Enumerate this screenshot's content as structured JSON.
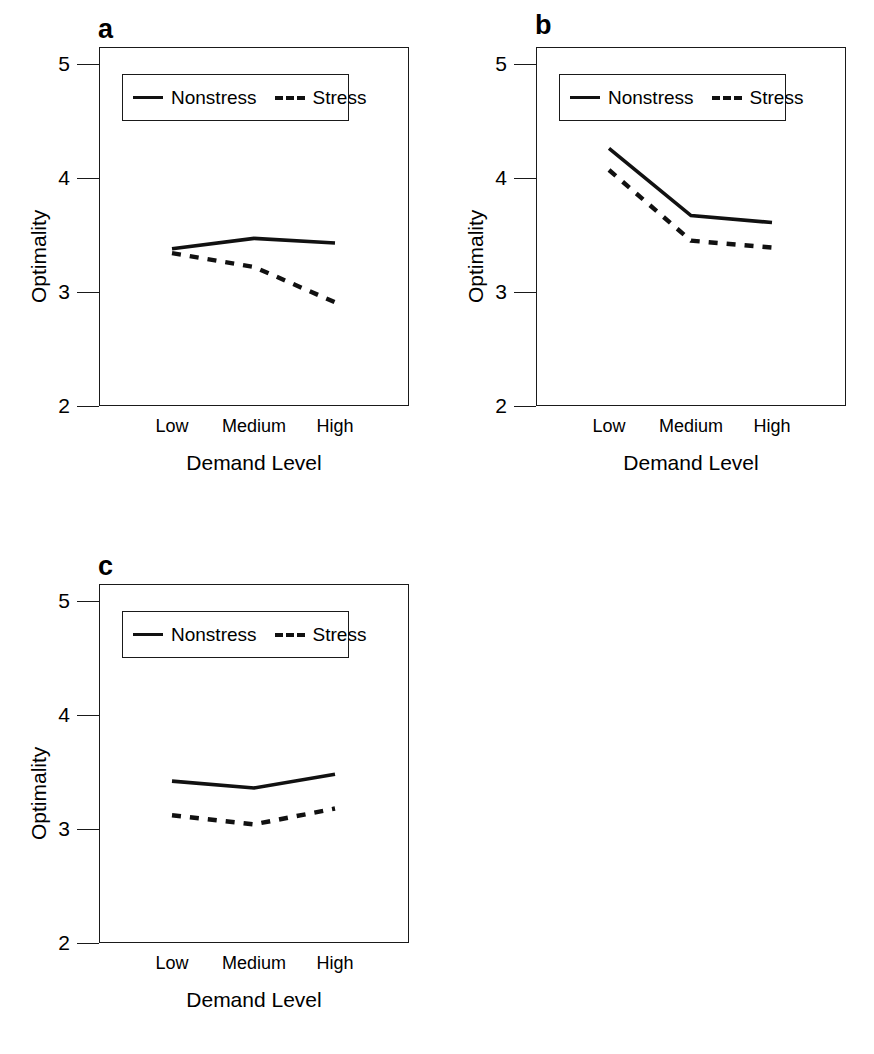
{
  "figure": {
    "background": "#ffffff",
    "line_color": "#111111",
    "panels": [
      "a",
      "b",
      "c"
    ]
  },
  "common": {
    "ylabel": "Optimality",
    "xlabel": "Demand Level",
    "categories": [
      "Low",
      "Medium",
      "High"
    ],
    "yticks": [
      "5",
      "4",
      "3",
      "2"
    ],
    "legend": {
      "nonstress_label": "Nonstress",
      "stress_label": "Stress"
    }
  },
  "panel_a": {
    "label": "a"
  },
  "panel_b": {
    "label": "b"
  },
  "panel_c": {
    "label": "c"
  },
  "chart_data": [
    {
      "type": "line",
      "panel": "a",
      "title": "a",
      "xlabel": "Demand Level",
      "ylabel": "Optimality",
      "categories": [
        "Low",
        "Medium",
        "High"
      ],
      "ylim": [
        2,
        5.2
      ],
      "yticks": [
        5,
        4,
        3,
        2
      ],
      "grid": false,
      "legend_position": "top-left-inside",
      "series": [
        {
          "name": "Nonstress",
          "style": "solid",
          "values": [
            3.38,
            3.47,
            3.43
          ]
        },
        {
          "name": "Stress",
          "style": "dashed",
          "values": [
            3.34,
            3.22,
            2.91
          ]
        }
      ]
    },
    {
      "type": "line",
      "panel": "b",
      "title": "b",
      "xlabel": "Demand Level",
      "ylabel": "Optimality",
      "categories": [
        "Low",
        "Medium",
        "High"
      ],
      "ylim": [
        2,
        5.2
      ],
      "yticks": [
        5,
        4,
        3,
        2
      ],
      "grid": false,
      "legend_position": "top-left-inside",
      "series": [
        {
          "name": "Nonstress",
          "style": "solid",
          "values": [
            4.26,
            3.67,
            3.61
          ]
        },
        {
          "name": "Stress",
          "style": "dashed",
          "values": [
            4.07,
            3.45,
            3.39
          ]
        }
      ]
    },
    {
      "type": "line",
      "panel": "c",
      "title": "c",
      "xlabel": "Demand Level",
      "ylabel": "Optimality",
      "categories": [
        "Low",
        "Medium",
        "High"
      ],
      "ylim": [
        2,
        5.2
      ],
      "yticks": [
        5,
        4,
        3,
        2
      ],
      "grid": false,
      "legend_position": "top-left-inside",
      "series": [
        {
          "name": "Nonstress",
          "style": "solid",
          "values": [
            3.42,
            3.36,
            3.48
          ]
        },
        {
          "name": "Stress",
          "style": "dashed",
          "values": [
            3.12,
            3.04,
            3.18
          ]
        }
      ]
    }
  ]
}
